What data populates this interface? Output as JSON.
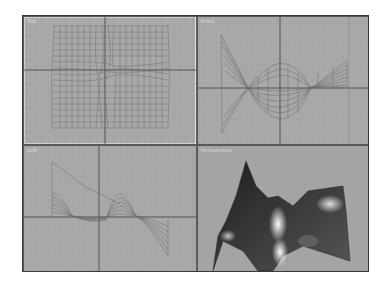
{
  "viewports": [
    {
      "id": "top",
      "label": "Top",
      "active": true
    },
    {
      "id": "front",
      "label": "Front",
      "active": false
    },
    {
      "id": "left",
      "label": "Left",
      "active": false
    },
    {
      "id": "perspective",
      "label": "Perspective",
      "active": false
    }
  ],
  "colors": {
    "viewport_bg": "#a9a9a9",
    "grid_line": "#9a9a9a",
    "axis_line": "#3c3c3c",
    "wireframe": "#6e6e6e",
    "active_border": "#e8e8e8"
  }
}
